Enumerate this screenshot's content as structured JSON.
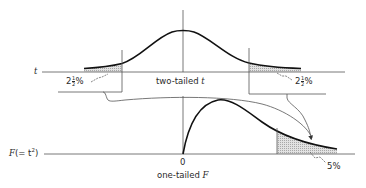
{
  "figure": {
    "colors": {
      "ink": "#1a1a1a",
      "axis": "#444444",
      "shade": "#c8c8c8"
    }
  },
  "top_panel": {
    "axis_label": "t",
    "caption": "two-tailed t",
    "left_tail": {
      "whole": "2",
      "num": "1",
      "den": "2",
      "unit": "%"
    },
    "right_tail": {
      "whole": "2",
      "num": "1",
      "den": "2",
      "unit": "%"
    }
  },
  "bottom_panel": {
    "axis_label_var": "F",
    "axis_label_rest": "(= t",
    "axis_label_sup": "2",
    "axis_label_close": ")",
    "origin_label": "0",
    "caption_prefix": "one-tailed ",
    "caption_var": "F",
    "tail_label": "5%"
  }
}
